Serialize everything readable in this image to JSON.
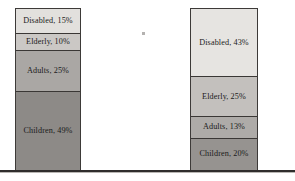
{
  "figure": {
    "title": "",
    "baseline_color": "#2f2d2c",
    "background": "#ffffff"
  },
  "chart_data": {
    "type": "bar",
    "title": "",
    "xlabel": "",
    "ylabel": "",
    "ylim": [
      0,
      100
    ],
    "stacked": true,
    "orientation": "vertical",
    "grid": false,
    "legend": "none (in-segment data labels)",
    "categories": [
      "Bar 1",
      "Bar 2"
    ],
    "segment_order_top_to_bottom": [
      "Disabled",
      "Elderly",
      "Adults",
      "Children"
    ],
    "series": [
      {
        "name": "Disabled",
        "values": [
          15,
          43
        ],
        "color": "#e0dedb"
      },
      {
        "name": "Elderly",
        "values": [
          10,
          25
        ],
        "color": "#c9c6c3"
      },
      {
        "name": "Adults",
        "values": [
          25,
          13
        ],
        "color": "#a9a6a3"
      },
      {
        "name": "Children",
        "values": [
          49,
          20
        ],
        "color": "#8e8b88"
      }
    ]
  },
  "bars": {
    "left": {
      "name": "left-stacked-bar",
      "segments": [
        {
          "label": "Disabled, 15%",
          "category": "Disabled",
          "value": 15,
          "color": "#e2e0dd"
        },
        {
          "label": "Elderly, 10%",
          "category": "Elderly",
          "value": 10,
          "color": "#cbc8c5"
        },
        {
          "label": "Adults, 25%",
          "category": "Adults",
          "value": 25,
          "color": "#aaa7a4"
        },
        {
          "label": "Children, 49%",
          "category": "Children",
          "value": 49,
          "color": "#8d8a87"
        }
      ]
    },
    "right": {
      "name": "right-stacked-bar",
      "segments": [
        {
          "label": "Disabled, 43%",
          "category": "Disabled",
          "value": 43,
          "color": "#e6e4e1"
        },
        {
          "label": "Elderly, 25%",
          "category": "Elderly",
          "value": 25,
          "color": "#c3c0bd"
        },
        {
          "label": "Adults, 13%",
          "category": "Adults",
          "value": 13,
          "color": "#aeaba8"
        },
        {
          "label": "Children, 20%",
          "category": "Children",
          "value": 20,
          "color": "#969390"
        }
      ]
    }
  }
}
